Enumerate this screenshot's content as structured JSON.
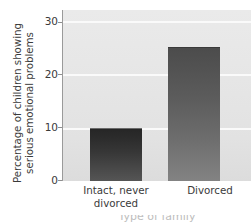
{
  "chart_data": {
    "type": "bar",
    "title": "",
    "subtitle": "",
    "xlabel": "Type of family",
    "ylabel_line1": "Percentage of children showing",
    "ylabel_line2": "serious emotional problems",
    "ylabel": "Percentage of children showing serious emotional problems",
    "categories": [
      "Intact, never divorced",
      "Divorced"
    ],
    "category_lines": [
      [
        "Intact, never",
        "divorced"
      ],
      [
        "Divorced"
      ]
    ],
    "values": [
      10,
      25
    ],
    "ylim": [
      0,
      32
    ],
    "yticks": [
      0,
      10,
      20,
      30
    ],
    "ytick_labels": [
      "0",
      "10",
      "20",
      "30"
    ],
    "grid": true,
    "grid_axis": "y",
    "legend": "none",
    "legend_position": "none",
    "bar_colors": [
      "#2f2f2f",
      "#5e5e5e"
    ],
    "plot_background": "#e6e6e6",
    "gridline_color": "#fafafa",
    "axis_color": "#9a9a9a",
    "text_color": "#3a3a3a"
  }
}
